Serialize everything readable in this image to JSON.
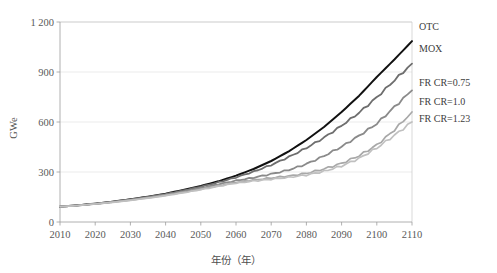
{
  "chart_data": {
    "type": "line",
    "title": "",
    "xlabel": "年份（年）",
    "ylabel": "GWe",
    "xlim": [
      2010,
      2110
    ],
    "ylim": [
      0,
      1200
    ],
    "grid": true,
    "legend_position": "right-inline-end-labels",
    "y_ticks": [
      "0",
      "300",
      "600",
      "900",
      "1 200"
    ],
    "y_tick_values": [
      0,
      300,
      600,
      900,
      1200
    ],
    "x_ticks": [
      "2010",
      "2020",
      "2030",
      "2040",
      "2050",
      "2060",
      "2070",
      "2080",
      "2090",
      "2100",
      "2110"
    ],
    "x": [
      2010,
      2015,
      2020,
      2025,
      2030,
      2035,
      2040,
      2045,
      2050,
      2055,
      2060,
      2065,
      2070,
      2075,
      2080,
      2085,
      2090,
      2095,
      2100,
      2105,
      2110
    ],
    "series": [
      {
        "name": "OTC",
        "color": "#111111",
        "width": 2.0,
        "values": [
          92,
          100,
          110,
          122,
          136,
          152,
          170,
          192,
          216,
          244,
          278,
          318,
          366,
          424,
          492,
          570,
          660,
          758,
          870,
          975,
          1085
        ]
      },
      {
        "name": "MOX",
        "color": "#6e6e6e",
        "width": 1.8,
        "values": [
          92,
          100,
          110,
          122,
          136,
          151,
          168,
          189,
          212,
          238,
          268,
          302,
          342,
          390,
          444,
          506,
          578,
          656,
          748,
          850,
          950
        ]
      },
      {
        "name": "FR CR=0.75",
        "color": "#8a8a8a",
        "width": 1.8,
        "values": [
          92,
          100,
          109,
          120,
          133,
          148,
          164,
          183,
          204,
          226,
          248,
          266,
          288,
          312,
          348,
          396,
          452,
          518,
          590,
          690,
          790
        ]
      },
      {
        "name": "FR CR=1.0",
        "color": "#a8a8a8",
        "width": 1.7,
        "values": [
          92,
          99,
          108,
          119,
          131,
          145,
          160,
          178,
          197,
          218,
          238,
          252,
          264,
          276,
          292,
          318,
          352,
          398,
          462,
          552,
          660
        ]
      },
      {
        "name": "FR CR=1.23",
        "color": "#c0c0c0",
        "width": 1.7,
        "values": [
          92,
          99,
          108,
          118,
          130,
          143,
          158,
          175,
          194,
          214,
          233,
          246,
          257,
          268,
          282,
          304,
          336,
          382,
          444,
          520,
          600
        ]
      }
    ],
    "end_labels": [
      {
        "text": "OTC",
        "y_value": 1085
      },
      {
        "text": "MOX",
        "y_value": 950
      },
      {
        "text": "FR CR=0.75",
        "y_value": 790
      },
      {
        "text": "FR CR=1.0",
        "y_value": 660
      },
      {
        "text": "FR CR=1.23",
        "y_value": 600
      }
    ]
  }
}
